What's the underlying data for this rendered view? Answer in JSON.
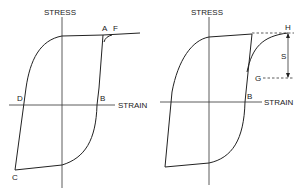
{
  "diagrams": [
    {
      "id": "left",
      "y_axis_label": "STRESS",
      "x_axis_label": "STRAIN",
      "point_labels": {
        "A": "A",
        "F": "F",
        "B": "B",
        "C": "C",
        "D": "D"
      }
    },
    {
      "id": "right",
      "y_axis_label": "STRESS",
      "x_axis_label": "STRAIN",
      "point_labels": {
        "H": "H",
        "S": "S",
        "G": "G",
        "B": "B"
      }
    }
  ],
  "colors": {
    "line": "#222222",
    "background": "#ffffff"
  }
}
